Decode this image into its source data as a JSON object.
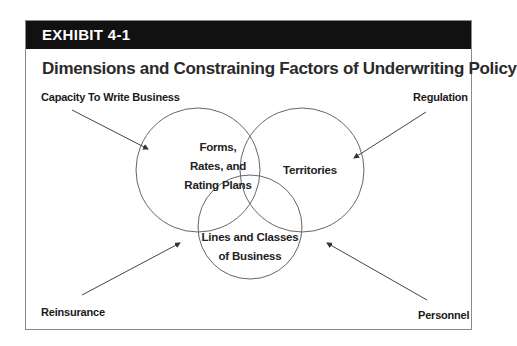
{
  "exhibit": {
    "label": "EXHIBIT 4-1",
    "title": "Dimensions and Constraining Factors of Underwriting Policy"
  },
  "constraining_factors": [
    {
      "label": "Capacity To Write Business",
      "position": "top-left"
    },
    {
      "label": "Regulation",
      "position": "top-right"
    },
    {
      "label": "Reinsurance",
      "position": "bottom-left"
    },
    {
      "label": "Personnel",
      "position": "bottom-right"
    }
  ],
  "dimensions": [
    {
      "label_lines": [
        "Forms,",
        "Rates, and",
        "Rating Plans"
      ]
    },
    {
      "label_lines": [
        "Territories"
      ]
    },
    {
      "label_lines": [
        "Lines and Classes",
        "of Business"
      ]
    }
  ],
  "colors": {
    "header_bg": "#111111",
    "header_text": "#ffffff",
    "line": "#555555"
  }
}
